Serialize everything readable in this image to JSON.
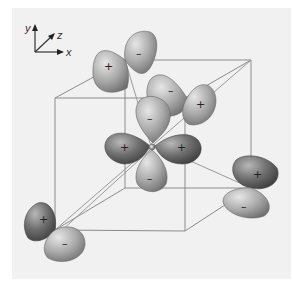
{
  "figure": {
    "title": "",
    "type": "orbital-diagram",
    "background_color": "#f1f1f1",
    "cube_edge_color": "#8a8a8a"
  },
  "axes_indicator": {
    "x_label": "x",
    "y_label": "y",
    "z_label": "z"
  },
  "orbital_groups": [
    {
      "id": "top-back",
      "lobes": [
        {
          "sign": "+",
          "position": "left"
        },
        {
          "sign": "–",
          "position": "right"
        }
      ]
    },
    {
      "id": "center-upper",
      "lobes": [
        {
          "sign": "–",
          "position": "upper"
        },
        {
          "sign": "+",
          "position": "right"
        }
      ]
    },
    {
      "id": "center",
      "lobes": [
        {
          "sign": "–",
          "position": "top"
        },
        {
          "sign": "+",
          "position": "left"
        },
        {
          "sign": "+",
          "position": "right"
        },
        {
          "sign": "–",
          "position": "bottom"
        }
      ]
    },
    {
      "id": "right",
      "lobes": [
        {
          "sign": "+",
          "position": "upper"
        },
        {
          "sign": "–",
          "position": "lower"
        }
      ]
    },
    {
      "id": "bottom-left",
      "lobes": [
        {
          "sign": "+",
          "position": "upper"
        },
        {
          "sign": "–",
          "position": "lower"
        }
      ]
    }
  ]
}
